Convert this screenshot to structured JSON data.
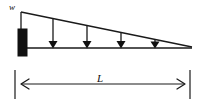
{
  "figure": {
    "type": "engineering-diagram",
    "background_color": "#ffffff",
    "stroke_color": "#1a1a1a",
    "fill_color": "#111111"
  },
  "labels": {
    "load_intensity": "w",
    "span_length": "L"
  },
  "geometry": {
    "wall_block": {
      "x": 18,
      "y": 29,
      "width": 9,
      "height": 27
    },
    "beam_line": {
      "x1": 22,
      "y1": 48,
      "x2": 192,
      "y2": 48
    },
    "load_top_line": {
      "x1": 21,
      "y1": 12,
      "x2": 192,
      "y2": 47
    },
    "load_left_edge": {
      "x1": 21,
      "y1": 12,
      "x2": 21,
      "y2": 48
    },
    "arrow_x_positions": [
      53,
      87,
      121,
      155
    ],
    "dimension_line": {
      "x1": 22,
      "y1": 84,
      "x2": 190,
      "y2": 84
    },
    "extension_tick_left": {
      "x": 15,
      "y1": 70,
      "y2": 99
    },
    "extension_tick_right": {
      "x": 190,
      "y1": 70,
      "y2": 99
    }
  },
  "annotations": {
    "w_position": {
      "x": 9,
      "y": 10
    },
    "L_position": {
      "x": 100,
      "y": 82
    }
  }
}
